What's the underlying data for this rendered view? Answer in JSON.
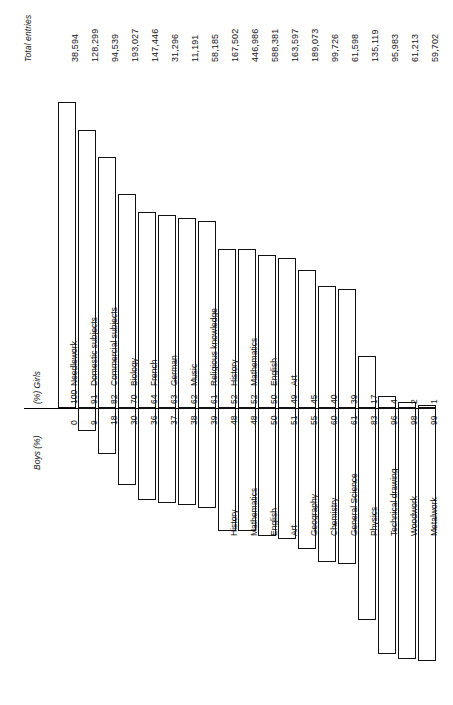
{
  "labels": {
    "totals_header": "Total entries",
    "left_axis_caption": "Boys (%)",
    "right_axis_caption": "(%) Girls"
  },
  "chart_data": {
    "type": "bar",
    "title": "",
    "subtitle": "",
    "orientation": "rotated-90-horizontal-diverging",
    "xlabel": "",
    "ylabel": "",
    "legend_position": "none",
    "grid": false,
    "axis_left_label": "Boys (%)",
    "axis_right_label": "(%) Girls",
    "value_axis_range": [
      0,
      100
    ],
    "value_axis_unit": "%",
    "series": [
      {
        "name": "Boys (%)",
        "values": [
          0,
          9,
          18,
          30,
          36,
          37,
          38,
          39,
          48,
          48,
          50,
          51,
          55,
          60,
          61,
          83,
          96,
          98,
          99
        ]
      },
      {
        "name": "Girls (%)",
        "values": [
          100,
          91,
          82,
          70,
          64,
          63,
          62,
          61,
          52,
          52,
          50,
          49,
          45,
          40,
          39,
          17,
          4,
          2,
          1
        ]
      }
    ],
    "categories": [
      "Needlework",
      "Domestic subjects",
      "Commercial subjects",
      "Biology",
      "French",
      "German",
      "Music",
      "Religious knowledge",
      "History",
      "Mathematics",
      "English",
      "Art",
      "Geography",
      "Chemistry",
      "General Science",
      "Physics",
      "Technical drawing",
      "Woodwork",
      "Metalwork"
    ],
    "extra_column": {
      "name": "Total entries",
      "values": [
        "38,594",
        "128,299",
        "94,539",
        "193,027",
        "147,446",
        "31,296",
        "11,191",
        "58,185",
        "167,502",
        "446,986",
        "588,381",
        "163,597",
        "189,073",
        "99,726",
        "61,598",
        "135,119",
        "95,983",
        "61,213",
        "59,702"
      ]
    }
  },
  "rows": [
    {
      "subject": "Needlework",
      "boys": "0",
      "girls": "100",
      "total": "38,594"
    },
    {
      "subject": "Domestic subjects",
      "boys": "9",
      "girls": "91",
      "total": "128,299"
    },
    {
      "subject": "Commercial subjects",
      "boys": "18",
      "girls": "82",
      "total": "94,539"
    },
    {
      "subject": "Biology",
      "boys": "30",
      "girls": "70",
      "total": "193,027"
    },
    {
      "subject": "French",
      "boys": "36",
      "girls": "64",
      "total": "147,446"
    },
    {
      "subject": "German",
      "boys": "37",
      "girls": "63",
      "total": "31,296"
    },
    {
      "subject": "Music",
      "boys": "38",
      "girls": "62",
      "total": "11,191"
    },
    {
      "subject": "Religious knowledge",
      "boys": "39",
      "girls": "61",
      "total": "58,185"
    },
    {
      "subject": "History",
      "boys": "48",
      "girls": "52",
      "total": "167,502"
    },
    {
      "subject": "Mathematics",
      "boys": "48",
      "girls": "52",
      "total": "446,986"
    },
    {
      "subject": "English",
      "boys": "50",
      "girls": "50",
      "total": "588,381"
    },
    {
      "subject": "Art",
      "boys": "51",
      "girls": "49",
      "total": "163,597"
    },
    {
      "subject": "Geography",
      "boys": "55",
      "girls": "45",
      "total": "189,073"
    },
    {
      "subject": "Chemistry",
      "boys": "60",
      "girls": "40",
      "total": "99,726"
    },
    {
      "subject": "General Science",
      "boys": "61",
      "girls": "39",
      "total": "61,598"
    },
    {
      "subject": "Physics",
      "boys": "83",
      "girls": "17",
      "total": "135,119"
    },
    {
      "subject": "Technical drawing",
      "boys": "96",
      "girls": "4",
      "total": "95,983"
    },
    {
      "subject": "Woodwork",
      "boys": "98",
      "girls": "2",
      "total": "61,213"
    },
    {
      "subject": "Metalwork",
      "boys": "99",
      "girls": "1",
      "total": "59,702"
    }
  ],
  "colors": {
    "ink": "#111111",
    "paper": "#ffffff"
  }
}
